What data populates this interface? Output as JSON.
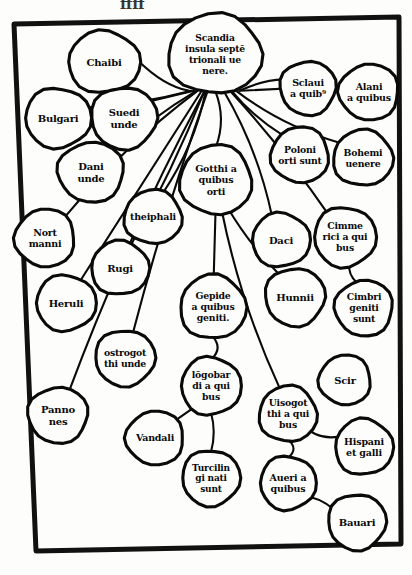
{
  "figure": {
    "style": "blackletter woodcut",
    "frame_color": "#111111",
    "ink_color": "#0a0a0a",
    "paper_color": "#fdfdfb",
    "top_cropped_text": "ffff"
  },
  "nodes": [
    {
      "id": "scandia",
      "lines": [
        "Scandia",
        "insula septē",
        "trionali ue",
        "nere."
      ],
      "cx": 215,
      "cy": 54,
      "rx": 47,
      "ry": 40,
      "font": 9.2
    },
    {
      "id": "chaibi",
      "lines": [
        "Chaibi"
      ],
      "cx": 104,
      "cy": 62,
      "rx": 36,
      "ry": 31,
      "font": 10
    },
    {
      "id": "bulgari",
      "lines": [
        "Bulgari"
      ],
      "cx": 58,
      "cy": 118,
      "rx": 33,
      "ry": 30,
      "font": 10
    },
    {
      "id": "suedi",
      "lines": [
        "Suedi",
        "unde"
      ],
      "cx": 124,
      "cy": 118,
      "rx": 33,
      "ry": 31,
      "font": 10
    },
    {
      "id": "dani",
      "lines": [
        "Dani",
        "unde"
      ],
      "cx": 91,
      "cy": 172,
      "rx": 33,
      "ry": 30,
      "font": 10
    },
    {
      "id": "nortmanni",
      "lines": [
        "Nort",
        "manni"
      ],
      "cx": 45,
      "cy": 238,
      "rx": 30,
      "ry": 29,
      "font": 9.5
    },
    {
      "id": "theiphali",
      "lines": [
        "theiphali"
      ],
      "cx": 153,
      "cy": 217,
      "rx": 29,
      "ry": 27,
      "font": 9.5
    },
    {
      "id": "rugi",
      "lines": [
        "Rugi"
      ],
      "cx": 120,
      "cy": 268,
      "rx": 29,
      "ry": 27,
      "font": 10
    },
    {
      "id": "heruli",
      "lines": [
        "Heruli"
      ],
      "cx": 66,
      "cy": 303,
      "rx": 30,
      "ry": 28,
      "font": 10
    },
    {
      "id": "ostrogotthi",
      "lines": [
        "ostrogot",
        "thi unde"
      ],
      "cx": 125,
      "cy": 358,
      "rx": 30,
      "ry": 28,
      "font": 9.3
    },
    {
      "id": "pannones",
      "lines": [
        "Panno",
        "nes"
      ],
      "cx": 58,
      "cy": 415,
      "rx": 30,
      "ry": 28,
      "font": 10
    },
    {
      "id": "vandali",
      "lines": [
        "Vandali"
      ],
      "cx": 155,
      "cy": 438,
      "rx": 29,
      "ry": 27,
      "font": 9.5
    },
    {
      "id": "gotthi",
      "lines": [
        "Gotthi a",
        "quibus",
        "orti"
      ],
      "cx": 216,
      "cy": 180,
      "rx": 36,
      "ry": 35,
      "font": 9.5
    },
    {
      "id": "gepide",
      "lines": [
        "Gepide",
        "a quibus",
        "geniti."
      ],
      "cx": 213,
      "cy": 307,
      "rx": 33,
      "ry": 32,
      "font": 9.3
    },
    {
      "id": "longobardi",
      "lines": [
        "lōgobar",
        "di a qui",
        "bus"
      ],
      "cx": 211,
      "cy": 386,
      "rx": 30,
      "ry": 29,
      "font": 9.3
    },
    {
      "id": "turcilingi",
      "lines": [
        "Turcilin",
        "gi nati",
        "sunt"
      ],
      "cx": 211,
      "cy": 478,
      "rx": 29,
      "ry": 28,
      "font": 9
    },
    {
      "id": "sclaui",
      "lines": [
        "Sclaui",
        "a quib⁹"
      ],
      "cx": 308,
      "cy": 88,
      "rx": 28,
      "ry": 27,
      "font": 9.5
    },
    {
      "id": "alani",
      "lines": [
        "Alani",
        "a quibus"
      ],
      "cx": 369,
      "cy": 92,
      "rx": 30,
      "ry": 28,
      "font": 9.5
    },
    {
      "id": "poloni",
      "lines": [
        "Poloni",
        "orti sunt"
      ],
      "cx": 300,
      "cy": 155,
      "rx": 29,
      "ry": 28,
      "font": 9.3
    },
    {
      "id": "bohemi",
      "lines": [
        "Bohemi",
        "uenere"
      ],
      "cx": 363,
      "cy": 158,
      "rx": 30,
      "ry": 28,
      "font": 9.3
    },
    {
      "id": "daci",
      "lines": [
        "Daci"
      ],
      "cx": 281,
      "cy": 240,
      "rx": 29,
      "ry": 27,
      "font": 10
    },
    {
      "id": "cimmerici",
      "lines": [
        "Cimme",
        "rici a qui",
        "bus"
      ],
      "cx": 345,
      "cy": 237,
      "rx": 31,
      "ry": 30,
      "font": 9.3
    },
    {
      "id": "hunnii",
      "lines": [
        "Hunnii"
      ],
      "cx": 295,
      "cy": 297,
      "rx": 30,
      "ry": 29,
      "font": 10
    },
    {
      "id": "cimbri",
      "lines": [
        "Cimbri",
        "geniti",
        "sunt"
      ],
      "cx": 364,
      "cy": 308,
      "rx": 29,
      "ry": 28,
      "font": 9.3
    },
    {
      "id": "scir",
      "lines": [
        "Scir"
      ],
      "cx": 345,
      "cy": 380,
      "rx": 26,
      "ry": 25,
      "font": 10
    },
    {
      "id": "uisogotthi",
      "lines": [
        "Uisogot",
        "thi a qui",
        "bus"
      ],
      "cx": 288,
      "cy": 414,
      "rx": 29,
      "ry": 28,
      "font": 9.3
    },
    {
      "id": "hispani",
      "lines": [
        "Hispani",
        "et galli"
      ],
      "cx": 364,
      "cy": 447,
      "rx": 29,
      "ry": 28,
      "font": 9.5
    },
    {
      "id": "aueri",
      "lines": [
        "Aueri a",
        "quibus"
      ],
      "cx": 288,
      "cy": 483,
      "rx": 28,
      "ry": 27,
      "font": 9.5
    },
    {
      "id": "bauari",
      "lines": [
        "Bauari"
      ],
      "cx": 357,
      "cy": 522,
      "rx": 29,
      "ry": 28,
      "font": 10
    }
  ],
  "edges": [
    {
      "from": "scandia",
      "to": "chaibi"
    },
    {
      "from": "scandia",
      "to": "bulgari"
    },
    {
      "from": "scandia",
      "to": "suedi"
    },
    {
      "from": "scandia",
      "to": "dani"
    },
    {
      "from": "scandia",
      "to": "nortmanni"
    },
    {
      "from": "scandia",
      "to": "theiphali"
    },
    {
      "from": "scandia",
      "to": "rugi"
    },
    {
      "from": "scandia",
      "to": "heruli"
    },
    {
      "from": "scandia",
      "to": "ostrogotthi"
    },
    {
      "from": "scandia",
      "to": "pannones"
    },
    {
      "from": "scandia",
      "to": "gotthi"
    },
    {
      "from": "scandia",
      "to": "sclaui"
    },
    {
      "from": "scandia",
      "to": "alani"
    },
    {
      "from": "scandia",
      "to": "poloni"
    },
    {
      "from": "scandia",
      "to": "bohemi"
    },
    {
      "from": "scandia",
      "to": "daci"
    },
    {
      "from": "scandia",
      "to": "cimmerici"
    },
    {
      "from": "gotthi",
      "to": "gepide"
    },
    {
      "from": "gotthi",
      "to": "hunnii"
    },
    {
      "from": "gotthi",
      "to": "uisogotthi"
    },
    {
      "from": "gepide",
      "to": "longobardi"
    },
    {
      "from": "longobardi",
      "to": "turcilingi"
    },
    {
      "from": "longobardi",
      "to": "vandali"
    },
    {
      "from": "cimmerici",
      "to": "cimbri"
    },
    {
      "from": "uisogotthi",
      "to": "hispani"
    },
    {
      "from": "uisogotthi",
      "to": "aueri"
    },
    {
      "from": "aueri",
      "to": "bauari"
    }
  ]
}
